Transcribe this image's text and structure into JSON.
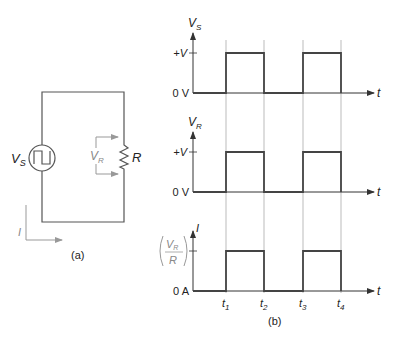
{
  "circuit": {
    "caption": "(a)",
    "source_label": "V",
    "source_sub": "S",
    "resistor_label": "R",
    "vr_label": "V",
    "vr_sub": "R",
    "current_label": "I"
  },
  "waveforms": {
    "caption": "(b)",
    "time_axis_label": "t",
    "panels": [
      {
        "y_label": "V",
        "y_sub": "S",
        "high_label": "+V",
        "zero_label": "0 V"
      },
      {
        "y_label": "V",
        "y_sub": "R",
        "high_label": "+V",
        "zero_label": "0 V"
      },
      {
        "y_label": "I",
        "y_sub": "",
        "high_num": "V",
        "high_num_sub": "R",
        "high_den": "R",
        "zero_label": "0 A"
      }
    ],
    "time_ticks": [
      {
        "label": "t",
        "sub": "1"
      },
      {
        "label": "t",
        "sub": "2"
      },
      {
        "label": "t",
        "sub": "3"
      },
      {
        "label": "t",
        "sub": "4"
      }
    ]
  },
  "colors": {
    "wire": "#555555",
    "waveform": "#444444",
    "gridline": "#aaaaaa",
    "annotation": "#888888"
  }
}
